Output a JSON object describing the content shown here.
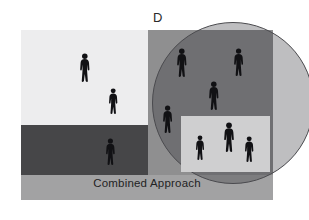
{
  "panel": {
    "label": "D",
    "caption": "Combined Approach"
  },
  "colors": {
    "background": "#ffffff",
    "upper_left_region": "#ededee",
    "right_region": "#8f8f90",
    "middle_dark_band": "#464648",
    "bottom_band": "#a2a2a3",
    "inner_rectangle": "#cfcfd0",
    "circle_overlay": "rgba(40,40,45,0.30)",
    "circle_stroke": "#4a4a4e",
    "figure_fill": "#111114",
    "label_text": "#2a2a2a",
    "caption_text": "#232323"
  },
  "regions": [
    {
      "name": "upper-left-light-region",
      "x": 21,
      "y": 30,
      "w": 127,
      "h": 95,
      "fill": "#ededee"
    },
    {
      "name": "upper-right-gray-region",
      "x": 148,
      "y": 30,
      "w": 125,
      "h": 95,
      "fill": "#8f8f90"
    },
    {
      "name": "middle-dark-band",
      "x": 21,
      "y": 125,
      "w": 127,
      "h": 50,
      "fill": "#464648"
    },
    {
      "name": "middle-right-gray-band",
      "x": 148,
      "y": 125,
      "w": 125,
      "h": 50,
      "fill": "#8f8f90"
    },
    {
      "name": "bottom-caption-band",
      "x": 21,
      "y": 175,
      "w": 252,
      "h": 25,
      "fill": "#a2a2a3"
    },
    {
      "name": "inner-light-rectangle",
      "x": 181,
      "y": 116,
      "w": 89,
      "h": 56,
      "fill": "#cfcfd0"
    }
  ],
  "circle": {
    "name": "cluster-circle",
    "center_x": 212,
    "center_y": 103,
    "radius": 81
  },
  "figures": [
    {
      "id": "person-1",
      "x": 85,
      "y": 53,
      "h": 29,
      "region": "upper-left-light-region"
    },
    {
      "id": "person-2",
      "x": 113,
      "y": 88,
      "h": 26,
      "region": "upper-left-light-region"
    },
    {
      "id": "person-3",
      "x": 110,
      "y": 138,
      "h": 27,
      "region": "middle-dark-band"
    },
    {
      "id": "person-4",
      "x": 182,
      "y": 48,
      "h": 29,
      "region": "cluster-circle"
    },
    {
      "id": "person-5",
      "x": 239,
      "y": 48,
      "h": 28,
      "region": "cluster-circle"
    },
    {
      "id": "person-6",
      "x": 214,
      "y": 81,
      "h": 29,
      "region": "cluster-circle"
    },
    {
      "id": "person-7",
      "x": 168,
      "y": 105,
      "h": 28,
      "region": "cluster-circle"
    },
    {
      "id": "person-8",
      "x": 200,
      "y": 135,
      "h": 25,
      "region": "inner-light-rectangle"
    },
    {
      "id": "person-9",
      "x": 229,
      "y": 122,
      "h": 30,
      "region": "inner-light-rectangle"
    },
    {
      "id": "person-10",
      "x": 249,
      "y": 136,
      "h": 26,
      "region": "inner-light-rectangle"
    }
  ]
}
